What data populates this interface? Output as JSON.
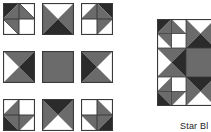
{
  "diagram": {
    "caption": "Star Bl",
    "colors": {
      "dark": "#2b2b2b",
      "medium": "#6b6b6b",
      "light": "#ffffff",
      "outline": "#3a3a3a"
    },
    "exploded_units": [
      {
        "row": 0,
        "col": 0,
        "type": "four-patch-hst",
        "orientation": "top-left"
      },
      {
        "row": 0,
        "col": 1,
        "type": "hourglass",
        "orientation": "top"
      },
      {
        "row": 0,
        "col": 2,
        "type": "four-patch-hst",
        "orientation": "top-right"
      },
      {
        "row": 1,
        "col": 0,
        "type": "hourglass",
        "orientation": "left"
      },
      {
        "row": 1,
        "col": 1,
        "type": "solid-square",
        "orientation": "center"
      },
      {
        "row": 1,
        "col": 2,
        "type": "hourglass",
        "orientation": "right"
      },
      {
        "row": 2,
        "col": 0,
        "type": "four-patch-hst",
        "orientation": "bottom-left"
      },
      {
        "row": 2,
        "col": 1,
        "type": "hourglass",
        "orientation": "bottom"
      },
      {
        "row": 2,
        "col": 2,
        "type": "four-patch-hst",
        "orientation": "bottom-right"
      }
    ],
    "assembled_block": {
      "label": "Star Block",
      "grid": "3x3"
    }
  }
}
